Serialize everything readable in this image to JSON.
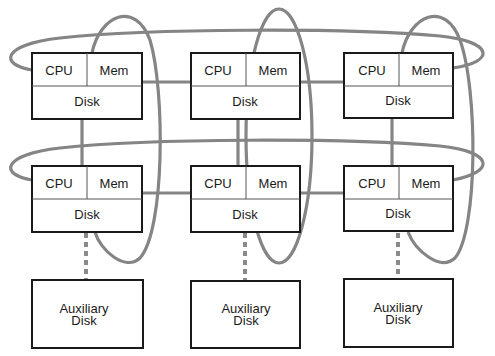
{
  "diagram": {
    "type": "cluster interconnect (node grid with ring networks)",
    "node_labels": {
      "cpu": "CPU",
      "mem": "Mem",
      "disk": "Disk"
    },
    "aux_label_line1": "Auxiliary",
    "aux_label_line2": "Disk",
    "nodes": [
      {
        "id": "n11",
        "row": 1,
        "col": 1
      },
      {
        "id": "n12",
        "row": 1,
        "col": 2
      },
      {
        "id": "n13",
        "row": 1,
        "col": 3
      },
      {
        "id": "n21",
        "row": 2,
        "col": 1
      },
      {
        "id": "n22",
        "row": 2,
        "col": 2
      },
      {
        "id": "n23",
        "row": 2,
        "col": 3
      }
    ],
    "aux_disks": [
      {
        "id": "a1",
        "col": 1
      },
      {
        "id": "a2",
        "col": 2
      },
      {
        "id": "a3",
        "col": 3
      }
    ],
    "rings": {
      "horizontal": [
        "row-1 ring",
        "row-2 ring"
      ],
      "vertical": [
        "col-1 ring",
        "col-2 ring",
        "col-3 ring"
      ]
    },
    "colors": {
      "ring": "#858585",
      "box_border": "#1a1a1a",
      "background": "#ffffff"
    }
  }
}
